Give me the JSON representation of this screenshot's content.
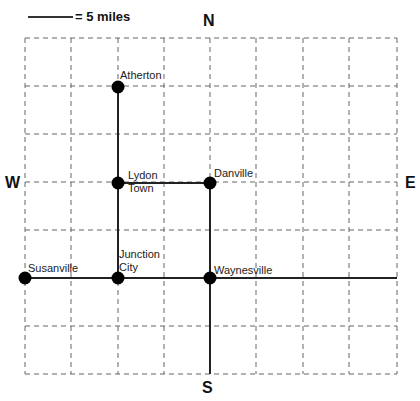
{
  "scale": {
    "label": "= 5 miles"
  },
  "compass": {
    "north": "N",
    "south": "S",
    "west": "W",
    "east": "E"
  },
  "grid": {
    "left": 25,
    "top": 38,
    "cell_w": 46.5,
    "cell_h": 48,
    "cols": 8,
    "rows": 7
  },
  "towns": [
    {
      "name": "Atherton",
      "line2": ""
    },
    {
      "name": "Lydon",
      "line2": "Town"
    },
    {
      "name": "Danville",
      "line2": ""
    },
    {
      "name": "Junction",
      "line2": "City"
    },
    {
      "name": "Susanville",
      "line2": ""
    },
    {
      "name": "Waynesville",
      "line2": ""
    }
  ]
}
